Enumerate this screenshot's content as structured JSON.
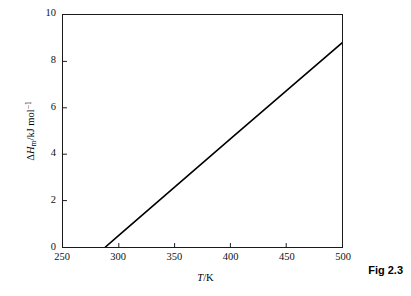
{
  "figure": {
    "caption": "Fig 2.3",
    "background_color": "#ffffff",
    "line_color": "#000000",
    "axis_color": "#1a1a1a"
  },
  "chart_data": {
    "type": "line",
    "title": "",
    "subtitle": "",
    "xlabel_parts": {
      "variable": "T",
      "separator": "/K"
    },
    "xlabel": "T/K",
    "ylabel_parts": {
      "delta": "Δ",
      "variable": "H",
      "subscript": "m",
      "separator": "/kJ mol",
      "superscript": "−1"
    },
    "ylabel": "ΔHm/kJ mol−1",
    "xlim": [
      250,
      500
    ],
    "ylim": [
      0,
      10
    ],
    "xticks": [
      250,
      300,
      350,
      400,
      450,
      500
    ],
    "yticks": [
      0,
      2,
      4,
      6,
      8,
      10
    ],
    "xtick_labels": [
      "250",
      "300",
      "350",
      "400",
      "450",
      "500"
    ],
    "ytick_labels": [
      "0",
      "2",
      "4",
      "6",
      "8",
      "10"
    ],
    "tick_direction": "in",
    "grid": false,
    "legend": null,
    "series": [
      {
        "name": "enthalpy of reaction",
        "x": [
          288,
          300,
          350,
          400,
          450,
          500
        ],
        "y": [
          0.0,
          0.5,
          2.58,
          4.66,
          6.73,
          8.8
        ],
        "line_width": 1.6,
        "color": "#000000"
      }
    ],
    "annotations": []
  }
}
